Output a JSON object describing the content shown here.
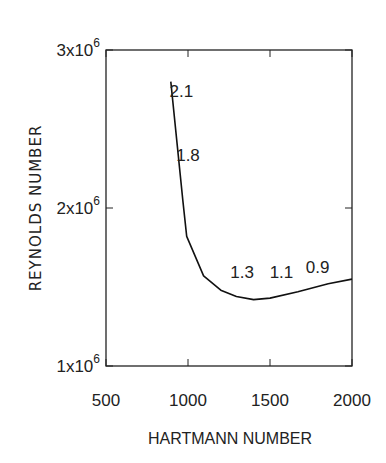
{
  "chart_data": {
    "type": "line",
    "title": "",
    "xlabel": "HARTMANN NUMBER",
    "ylabel": "REYNOLDS NUMBER",
    "xlim": [
      500,
      2000
    ],
    "ylim": [
      1000000,
      3000000
    ],
    "xticks": [
      500,
      1000,
      1500,
      2000
    ],
    "xtick_labels": [
      "500",
      "1000",
      "1500",
      "2000"
    ],
    "yticks": [
      1000000,
      2000000,
      3000000
    ],
    "ytick_labels": [
      {
        "base": "1x10",
        "exp": "6"
      },
      {
        "base": "2x10",
        "exp": "6"
      },
      {
        "base": "3x10",
        "exp": "6"
      }
    ],
    "grid": false,
    "legend": null,
    "series": [
      {
        "name": "critical Reynolds number",
        "x": [
          895,
          968,
          992,
          1095,
          1200,
          1295,
          1400,
          1500,
          1670,
          1855,
          2000
        ],
        "y": [
          2800000,
          2050000,
          1820000,
          1570000,
          1480000,
          1440000,
          1420000,
          1430000,
          1470000,
          1520000,
          1550000
        ]
      }
    ],
    "annotations": [
      {
        "text": "2.1",
        "x": 960,
        "y": 2700000
      },
      {
        "text": "1.8",
        "x": 1000,
        "y": 2300000
      },
      {
        "text": "1.3",
        "x": 1330,
        "y": 1560000
      },
      {
        "text": "1.1",
        "x": 1570,
        "y": 1560000
      },
      {
        "text": "0.9",
        "x": 1790,
        "y": 1590000
      }
    ]
  }
}
